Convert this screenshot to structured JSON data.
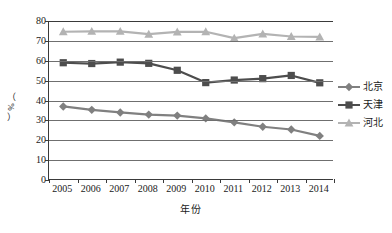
{
  "chart_data": {
    "type": "line",
    "title": "",
    "xlabel": "年份",
    "ylabel": "（%）",
    "categories": [
      "2005",
      "2006",
      "2007",
      "2008",
      "2009",
      "2010",
      "2011",
      "2012",
      "2013",
      "2014"
    ],
    "x": [
      2005,
      2006,
      2007,
      2008,
      2009,
      2010,
      2011,
      2012,
      2013,
      2014
    ],
    "ylim": [
      0,
      80
    ],
    "yticks": [
      0,
      10,
      20,
      30,
      40,
      50,
      60,
      70,
      80
    ],
    "grid": "horizontal",
    "legend_position": "right",
    "series": [
      {
        "name": "北京",
        "marker": "diamond",
        "color": "#808080",
        "values": [
          37.0,
          35.3,
          34.0,
          32.9,
          32.4,
          31.0,
          29.0,
          26.8,
          25.4,
          22.2
        ]
      },
      {
        "name": "天津",
        "marker": "square",
        "color": "#4d4d4d",
        "values": [
          59.0,
          58.6,
          59.3,
          58.7,
          55.2,
          49.0,
          50.3,
          51.0,
          52.6,
          48.9
        ]
      },
      {
        "name": "河北",
        "marker": "triangle",
        "color": "#b3b3b3",
        "values": [
          74.6,
          74.8,
          74.8,
          73.4,
          74.5,
          74.6,
          71.4,
          73.5,
          72.2,
          72.0
        ]
      }
    ]
  },
  "axis": {
    "y_tick_labels": [
      "80",
      "70",
      "60",
      "50",
      "40",
      "30",
      "20",
      "10",
      "0"
    ],
    "x_tick_labels": [
      "2005",
      "2006",
      "2007",
      "2008",
      "2009",
      "2010",
      "2011",
      "2012",
      "2013",
      "2014"
    ],
    "y_title_chars": [
      "（",
      "%",
      "）"
    ],
    "x_title": "年份"
  },
  "legend": {
    "items": [
      {
        "label": "北京",
        "marker": "diamond",
        "color": "#808080"
      },
      {
        "label": "天津",
        "marker": "square",
        "color": "#4d4d4d"
      },
      {
        "label": "河北",
        "marker": "triangle",
        "color": "#b3b3b3"
      }
    ]
  },
  "colors": {
    "background": "#ffffff",
    "axis": "#3a3a3a",
    "grid": "#6f6f6f",
    "beijing": "#808080",
    "tianjin": "#4d4d4d",
    "hebei": "#b3b3b3"
  }
}
